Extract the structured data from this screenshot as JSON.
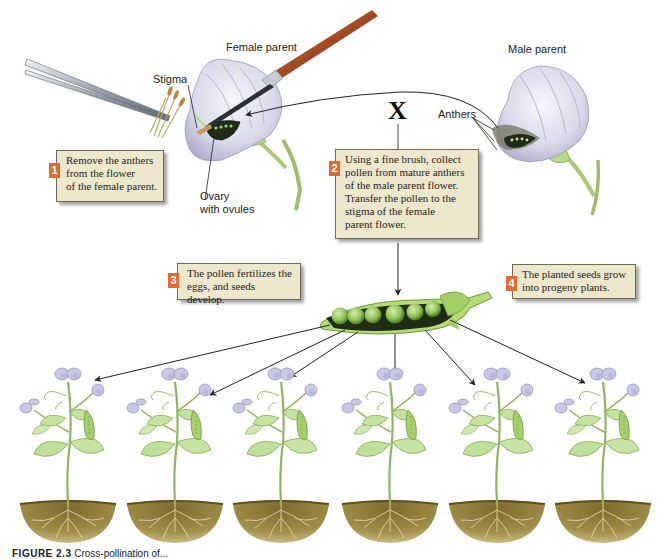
{
  "figure": {
    "labels": {
      "female_parent": "Female parent",
      "male_parent": "Male parent",
      "stigma": "Stigma",
      "anthers": "Anthers",
      "ovary": "Ovary\nwith ovules",
      "cross_symbol": "X"
    },
    "steps": [
      {
        "number": "1",
        "text": "Remove the anthers\nfrom the flower\nof the female parent."
      },
      {
        "number": "2",
        "text": "Using a fine brush, collect\npollen from mature anthers\nof the male parent flower.\nTransfer the pollen to the\nstigma of the female\nparent flower."
      },
      {
        "number": "3",
        "text": "The pollen fertilizes the\neggs, and seeds develop."
      },
      {
        "number": "4",
        "text": "The planted seeds grow\ninto progeny plants."
      }
    ],
    "progeny_plant_count": 6,
    "caption": {
      "figure_number": "FIGURE 2.3",
      "text": "Cross-pollination of..."
    }
  },
  "colors": {
    "callout_bg": "#ede8cc",
    "badge": "#e06a32",
    "petal": "#dcdcec",
    "petal_shade": "#a9a6c7",
    "leaf": "#b9d98a",
    "pod": "#8dbf4a",
    "soil": "#8a7a3a",
    "arrow": "#222222"
  }
}
